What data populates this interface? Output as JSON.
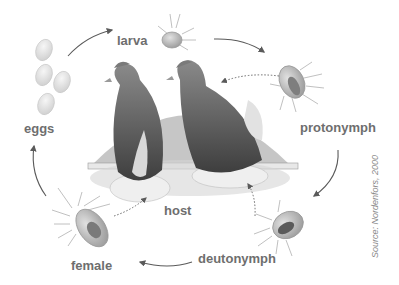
{
  "diagram": {
    "stages": [
      {
        "id": "eggs",
        "label": "eggs"
      },
      {
        "id": "larva",
        "label": "larva"
      },
      {
        "id": "protonymph",
        "label": "protonymph"
      },
      {
        "id": "deutonymph",
        "label": "deutonymph"
      },
      {
        "id": "female",
        "label": "female"
      },
      {
        "id": "host",
        "label": "host"
      }
    ],
    "cycle_order": [
      "eggs",
      "larva",
      "protonymph",
      "deutonymph",
      "female",
      "eggs"
    ],
    "feeding_links": [
      {
        "from": "protonymph",
        "to": "host",
        "style": "dotted"
      },
      {
        "from": "deutonymph",
        "to": "host",
        "style": "dotted"
      },
      {
        "from": "female",
        "to": "host",
        "style": "dotted"
      }
    ],
    "source": "Source: Nordenfors, 2000",
    "colors": {
      "label": "#6e6e6e",
      "arrow": "#5a5a5a",
      "background": "#ffffff",
      "hen_dark": "#4a4a4a",
      "backdrop": "#bdbdbd"
    }
  }
}
